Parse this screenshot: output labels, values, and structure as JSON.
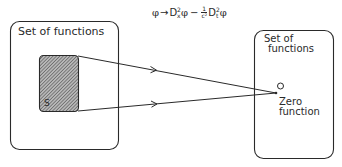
{
  "formula": {
    "phi": "φ",
    "arrow": "→",
    "d1": "D",
    "d1_sup": "2",
    "d1_sub": "x",
    "phi2": "φ",
    "minus": "−",
    "frac_num": "1",
    "frac_den": "c²",
    "d2": "D",
    "d2_sup": "2",
    "d2_sub": "t",
    "phi3": "φ"
  },
  "left_set": {
    "label": "Set of functions",
    "subset_label": "S"
  },
  "right_set": {
    "label_line1": "Set of",
    "label_line2": "functions",
    "zero_line1": "Zero",
    "zero_line2": "function"
  },
  "colors": {
    "stroke": "#2a2a2a",
    "hatch": "#555555",
    "background": "#ffffff"
  }
}
